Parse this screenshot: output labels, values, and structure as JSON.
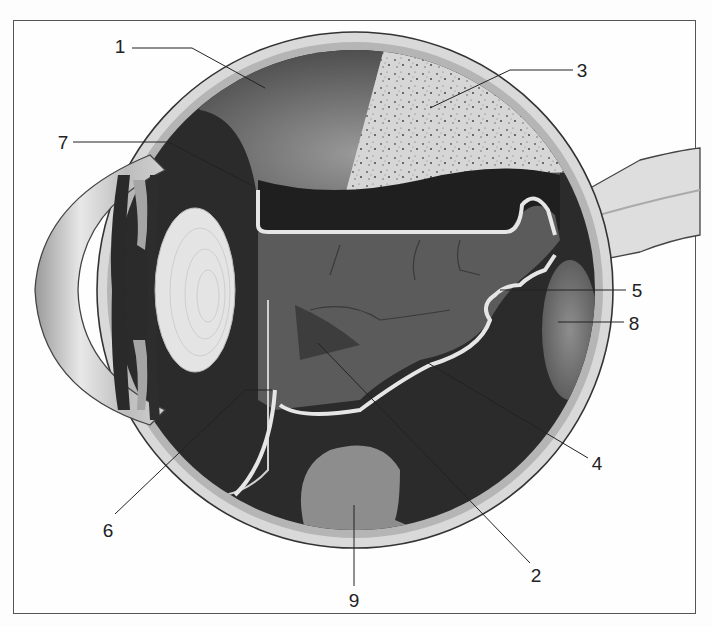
{
  "diagram": {
    "colors": {
      "frame": "#555555",
      "sclera": "#dcdcdc",
      "choroid": "#b8b8b8",
      "vitreous_dark": "#2a2a2a",
      "retina_mid": "#5a5a5a",
      "lens": "#e6e6e6",
      "membrane_line": "#e8e8e8",
      "leader_line": "#222222"
    },
    "labels": [
      {
        "id": "1",
        "text": "1",
        "x": 120,
        "y": 46
      },
      {
        "id": "2",
        "text": "2",
        "x": 536,
        "y": 575
      },
      {
        "id": "3",
        "text": "3",
        "x": 582,
        "y": 70
      },
      {
        "id": "4",
        "text": "4",
        "x": 597,
        "y": 463
      },
      {
        "id": "5",
        "text": "5",
        "x": 637,
        "y": 290
      },
      {
        "id": "6",
        "text": "6",
        "x": 108,
        "y": 530
      },
      {
        "id": "7",
        "text": "7",
        "x": 63,
        "y": 142
      },
      {
        "id": "8",
        "text": "8",
        "x": 634,
        "y": 323
      },
      {
        "id": "9",
        "text": "9",
        "x": 354,
        "y": 600
      }
    ]
  }
}
